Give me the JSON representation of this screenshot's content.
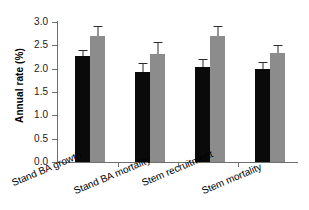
{
  "chart_data": {
    "type": "bar",
    "title": "",
    "xlabel": "",
    "ylabel": "Annual rate (%)",
    "ylim": [
      0.0,
      3.0
    ],
    "yticks": [
      "0.0",
      "0.5",
      "1.0",
      "1.5",
      "2.0",
      "2.5",
      "3.0"
    ],
    "ytick_values": [
      0.0,
      0.5,
      1.0,
      1.5,
      2.0,
      2.5,
      3.0
    ],
    "grid": false,
    "legend": "none",
    "categories": [
      "Stand BA growth",
      "Stand BA mortality",
      "Stem recruitment",
      "Stem mortality"
    ],
    "series": [
      {
        "name": "black",
        "color": "#0a0a0a",
        "values": [
          2.28,
          1.92,
          2.03,
          1.99
        ],
        "errors": [
          0.11,
          0.21,
          0.18,
          0.15
        ]
      },
      {
        "name": "gray",
        "color": "#8c8c8c",
        "values": [
          2.7,
          2.31,
          2.7,
          2.34
        ],
        "errors": [
          0.21,
          0.26,
          0.22,
          0.17
        ]
      }
    ]
  },
  "axis": {
    "y_label": "Annual rate (%)",
    "tick_labels": [
      "3.0",
      "2.5",
      "2.0",
      "1.5",
      "1.0",
      "0.5",
      "0.0"
    ]
  }
}
